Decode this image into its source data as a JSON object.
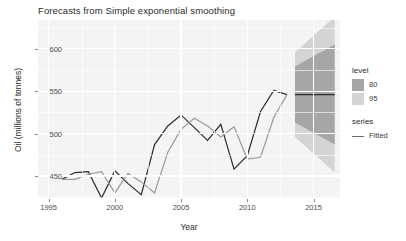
{
  "chart": {
    "title": "Forecasts from Simple exponential smoothing",
    "xlabel": "Year",
    "ylabel": "Oil (millions of tonnes)"
  },
  "legend": {
    "level": {
      "title": "level",
      "items": [
        {
          "label": "80",
          "color": "#a6a6a6"
        },
        {
          "label": "95",
          "color": "#d4d4d4"
        }
      ]
    },
    "series": {
      "title": "series",
      "items": [
        {
          "label": "Fitted",
          "color": "#6b6b6b"
        }
      ]
    }
  },
  "chart_data": {
    "type": "line",
    "title": "Forecasts from Simple exponential smoothing",
    "xlabel": "Year",
    "ylabel": "Oil (millions of tonnes)",
    "xlim": [
      1994.2,
      2017.0
    ],
    "ylim": [
      424,
      634
    ],
    "xticks": [
      1995,
      2000,
      2005,
      2010,
      2015
    ],
    "yticks": [
      450,
      500,
      550,
      600
    ],
    "grid": true,
    "legend_position": "right",
    "series": [
      {
        "name": "Data",
        "color": "#2b2b2b",
        "x": [
          1996,
          1997,
          1998,
          1999,
          2000,
          2001,
          2002,
          2003,
          2004,
          2005,
          2006,
          2007,
          2008,
          2009,
          2010,
          2011,
          2012,
          2013
        ],
        "values": [
          446,
          454,
          455,
          424,
          456,
          441,
          428,
          487,
          509,
          522,
          507,
          492,
          511,
          458,
          474,
          526,
          551,
          546
        ]
      },
      {
        "name": "Fitted",
        "color": "#9a9a9a",
        "x": [
          1996,
          1997,
          1998,
          1999,
          2000,
          2001,
          2002,
          2003,
          2004,
          2005,
          2006,
          2007,
          2008,
          2009,
          2010,
          2011,
          2012,
          2013
        ],
        "values": [
          446,
          446,
          452,
          455,
          430,
          453,
          443,
          430,
          478,
          505,
          518,
          509,
          496,
          508,
          470,
          472,
          519,
          546
        ]
      }
    ],
    "forecast": {
      "name": "Point forecast",
      "color": "#2b2b2b",
      "x": [
        2013.6,
        2016.6
      ],
      "mean": 546,
      "intervals": [
        {
          "level": 80,
          "color": "#a6a6a6",
          "lower_start": 513,
          "lower_end": 487,
          "upper_start": 579,
          "upper_end": 605
        },
        {
          "level": 95,
          "color": "#d4d4d4",
          "lower_start": 496,
          "lower_end": 454,
          "upper_start": 596,
          "upper_end": 638
        }
      ]
    }
  }
}
